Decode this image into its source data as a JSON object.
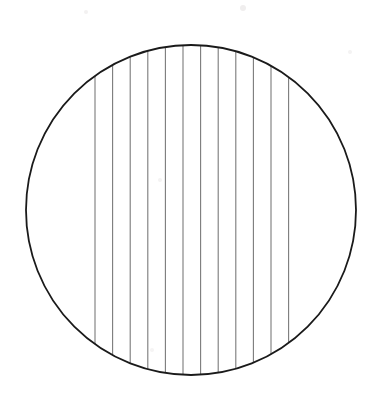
{
  "figure": {
    "canvas": {
      "width": 382,
      "height": 403,
      "background_color": "#ffffff"
    },
    "circle": {
      "label": "circle-outline",
      "center_x": 191,
      "center_y": 210,
      "radius": 165,
      "stroke_color": "#1a1a1a",
      "stroke_width": 1.8,
      "fill": "none"
    },
    "hatching": {
      "label": "vertical-hatch-lines",
      "orientation": "vertical",
      "count": 12,
      "spacing": 17.6,
      "first_x": 95,
      "last_x": 288.6,
      "stroke_color": "#7a7a7a",
      "stroke_width": 1.1,
      "clipped_to": "circle",
      "x_positions": [
        95,
        112.6,
        130.2,
        147.8,
        165.4,
        183,
        200.6,
        218.2,
        235.8,
        253.4,
        271,
        288.6
      ]
    },
    "artifacts": [
      {
        "label": "scan-speck-top",
        "x": 243,
        "y": 8,
        "radius": 3,
        "color": "#f0eeee"
      },
      {
        "label": "scan-speck-left-top",
        "x": 86,
        "y": 12,
        "radius": 2,
        "color": "#f3f1f1"
      },
      {
        "label": "scan-speck-center",
        "x": 160,
        "y": 180,
        "radius": 2,
        "color": "#f4f3f3"
      },
      {
        "label": "scan-speck-right",
        "x": 350,
        "y": 52,
        "radius": 2,
        "color": "#f4f3f3"
      },
      {
        "label": "scan-speck-bottom-left",
        "x": 152,
        "y": 350,
        "radius": 2,
        "color": "#f5f4f4"
      }
    ]
  }
}
